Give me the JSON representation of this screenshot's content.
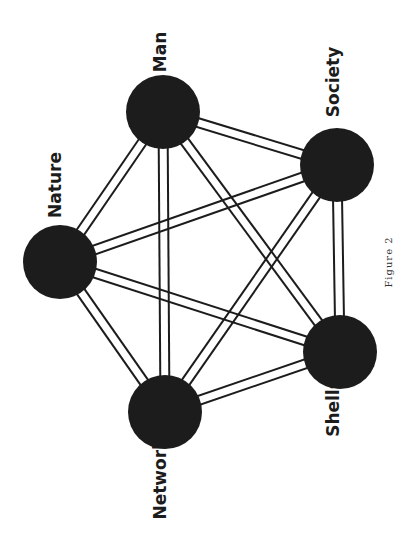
{
  "diagram": {
    "caption": "Figure 2",
    "nodes": [
      {
        "id": "man",
        "label": "Man",
        "cx": 163,
        "cy": 112,
        "r": 37,
        "lx": 160,
        "ly": 52
      },
      {
        "id": "society",
        "label": "Society",
        "cx": 337,
        "cy": 165,
        "r": 37,
        "lx": 333,
        "ly": 82
      },
      {
        "id": "nature",
        "label": "Nature",
        "cx": 60,
        "cy": 262,
        "r": 37,
        "lx": 55,
        "ly": 185
      },
      {
        "id": "networks",
        "label": "Networks",
        "cx": 165,
        "cy": 412,
        "r": 37,
        "lx": 160,
        "ly": 474
      },
      {
        "id": "shells",
        "label": "Shells",
        "cx": 340,
        "cy": 352,
        "r": 37,
        "lx": 333,
        "ly": 408
      }
    ],
    "edges": [
      [
        "man",
        "society"
      ],
      [
        "man",
        "nature"
      ],
      [
        "man",
        "networks"
      ],
      [
        "man",
        "shells"
      ],
      [
        "society",
        "nature"
      ],
      [
        "society",
        "networks"
      ],
      [
        "society",
        "shells"
      ],
      [
        "nature",
        "networks"
      ],
      [
        "nature",
        "shells"
      ],
      [
        "networks",
        "shells"
      ]
    ],
    "edge_style": "double-line",
    "colors": {
      "node": "#1c1c1c",
      "background": "#ffffff"
    }
  }
}
